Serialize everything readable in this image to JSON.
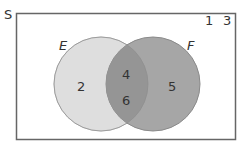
{
  "diagram": {
    "type": "venn",
    "universe": {
      "label": "S",
      "elements_outside": [
        "1",
        "3"
      ]
    },
    "sets": [
      {
        "name": "E",
        "label": "E",
        "only_elements": [
          "2"
        ]
      },
      {
        "name": "F",
        "label": "F",
        "only_elements": [
          "5"
        ]
      }
    ],
    "intersection": {
      "label": "E ∩ F",
      "elements": [
        "4",
        "6"
      ]
    },
    "colors": {
      "frame": "#666666",
      "set_e_fill": "#dedede",
      "set_f_fill": "#a6a6a6",
      "intersection_fill": "#959595",
      "set_e_stroke": "#cfcfcf",
      "set_f_stroke": "#8a8a8a",
      "text": "#333333"
    }
  },
  "labels": {
    "universe": "S",
    "set_e": "E",
    "set_f": "F",
    "outside_1": "1",
    "outside_2": "3",
    "e_only": "2",
    "f_only": "5",
    "both_1": "4",
    "both_2": "6"
  }
}
